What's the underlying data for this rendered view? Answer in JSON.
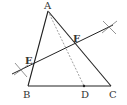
{
  "diagram": {
    "type": "geometry-construction",
    "points": {
      "A": {
        "label": "A",
        "x": 48,
        "y": 11
      },
      "B": {
        "label": "B",
        "x": 28,
        "y": 86
      },
      "C": {
        "label": "C",
        "x": 111,
        "y": 86
      },
      "D": {
        "label": "D",
        "x": 84,
        "y": 86
      },
      "E": {
        "label": "E",
        "x": 33,
        "y": 65
      },
      "F": {
        "label": "F",
        "x": 75,
        "y": 45
      }
    },
    "segments": [
      {
        "from": "A",
        "to": "B",
        "style": "solid"
      },
      {
        "from": "A",
        "to": "C",
        "style": "solid"
      },
      {
        "from": "B",
        "to": "C",
        "style": "solid"
      },
      {
        "from": "A",
        "to": "D",
        "style": "dashed"
      }
    ],
    "bisector_line": {
      "x1": 12,
      "y1": 74,
      "x2": 113,
      "y2": 25,
      "passes_through": [
        "E",
        "F"
      ]
    },
    "arc_marks": [
      {
        "x": 21,
        "y": 70
      },
      {
        "x": 109,
        "y": 27
      }
    ],
    "colors": {
      "line": "#222222",
      "dashed": "#888888",
      "label": "#333333",
      "arc": "#666666"
    }
  }
}
